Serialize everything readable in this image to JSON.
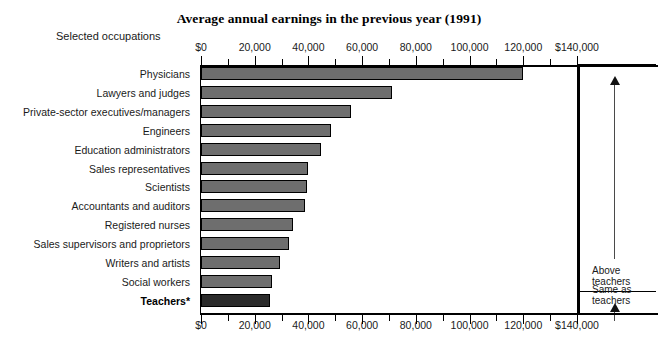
{
  "chart_data": {
    "type": "bar",
    "orientation": "horizontal",
    "title": "Average annual earnings in the previous year (1991)",
    "ylabel": "Selected occupations",
    "xlabel": "",
    "xlim": [
      0,
      140000
    ],
    "grid": false,
    "legend": "none",
    "tick_labels": [
      "$0",
      "20,000",
      "40,000",
      "60,000",
      "80,000",
      "100,000",
      "120,000",
      "$140,000"
    ],
    "tick_values": [
      0,
      20000,
      40000,
      60000,
      80000,
      100000,
      120000,
      140000
    ],
    "minor_tick_step": 10000,
    "categories": [
      "Physicians",
      "Lawyers and judges",
      "Private-sector executives/managers",
      "Engineers",
      "Education administrators",
      "Sales representatives",
      "Scientists",
      "Accountants and auditors",
      "Registered nurses",
      "Sales supervisors and proprietors",
      "Writers and artists",
      "Social workers",
      "Teachers*"
    ],
    "values": [
      120000,
      71000,
      56000,
      48500,
      44500,
      40000,
      39500,
      38700,
      34100,
      32900,
      29500,
      26600,
      25800
    ],
    "bar_color": "#6e6e6e",
    "highlight_color": "#2b2b2b",
    "highlight_category": "Teachers*"
  },
  "annotations": {
    "brackets": [
      {
        "label": "Above\nteachers",
        "start_category": "Physicians",
        "end_category": "Social workers"
      },
      {
        "label": "Same as\nteachers",
        "start_category": "Teachers*",
        "end_category": "Teachers*"
      }
    ]
  }
}
